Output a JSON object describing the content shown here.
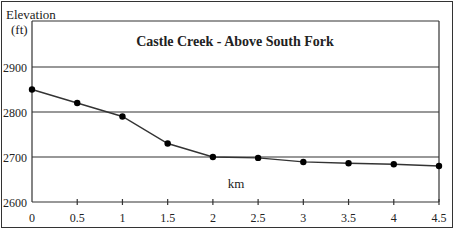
{
  "chart_data": {
    "type": "line",
    "title": "Castle Creek - Above South Fork",
    "xlabel": "km",
    "ylabel_line1": "Elevation",
    "ylabel_line2": "(ft)",
    "x": [
      0,
      0.5,
      1,
      1.5,
      2,
      2.5,
      3,
      3.5,
      4,
      4.5
    ],
    "x_tick_labels": [
      "0",
      "0.5",
      "1",
      "1.5",
      "2",
      "2.5",
      "3",
      "3.5",
      "4",
      "4.5"
    ],
    "y_tick_labels": [
      "2600",
      "2700",
      "2800",
      "2900"
    ],
    "series": [
      {
        "name": "Elevation",
        "values": [
          2850,
          2820,
          2790,
          2730,
          2700,
          2698,
          2689,
          2686,
          2684,
          2680
        ]
      }
    ],
    "ylim": [
      2600,
      2950
    ],
    "xlim": [
      0,
      4.5
    ],
    "grid": "horizontal",
    "legend": "none",
    "colors": {
      "line": "#333333",
      "marker": "#000000",
      "grid": "#333333"
    }
  }
}
